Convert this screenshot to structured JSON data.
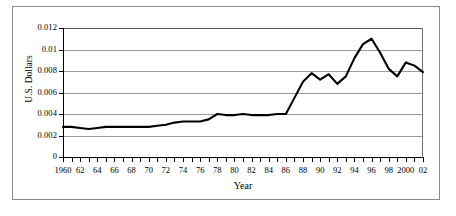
{
  "chart_data": {
    "type": "line",
    "title": "",
    "xlabel": "Year",
    "ylabel": "U.S. Dollars",
    "ylim": [
      0,
      0.012
    ],
    "xlim": [
      1960,
      2002
    ],
    "grid": true,
    "legend": "none",
    "ytick_labels": [
      "0.012",
      "0.01",
      "0.008",
      "0.006",
      "0.004",
      "0.002",
      "0"
    ],
    "ytick_values": [
      0.012,
      0.01,
      0.008,
      0.006,
      0.004,
      0.002,
      0
    ],
    "xtick_labels": [
      "1960",
      "62",
      "64",
      "66",
      "68",
      "70",
      "72",
      "74",
      "76",
      "78",
      "80",
      "82",
      "84",
      "86",
      "88",
      "90",
      "92",
      "94",
      "96",
      "98",
      "2000",
      "02"
    ],
    "xtick_values": [
      1960,
      1962,
      1964,
      1966,
      1968,
      1970,
      1972,
      1974,
      1976,
      1978,
      1980,
      1982,
      1984,
      1986,
      1988,
      1990,
      1992,
      1994,
      1996,
      1998,
      2000,
      2002
    ],
    "x": [
      1960,
      1961,
      1962,
      1963,
      1964,
      1965,
      1966,
      1967,
      1968,
      1969,
      1970,
      1971,
      1972,
      1973,
      1974,
      1975,
      1976,
      1977,
      1978,
      1979,
      1980,
      1981,
      1982,
      1983,
      1984,
      1985,
      1986,
      1987,
      1988,
      1989,
      1990,
      1991,
      1992,
      1993,
      1994,
      1995,
      1996,
      1997,
      1998,
      1999,
      2000,
      2001,
      2002
    ],
    "values": [
      0.0028,
      0.0028,
      0.0027,
      0.0026,
      0.0027,
      0.0028,
      0.0028,
      0.0028,
      0.0028,
      0.0028,
      0.0028,
      0.0029,
      0.003,
      0.0032,
      0.0033,
      0.0033,
      0.0033,
      0.0035,
      0.004,
      0.0039,
      0.0039,
      0.004,
      0.0039,
      0.0039,
      0.0039,
      0.004,
      0.004,
      0.0055,
      0.007,
      0.0078,
      0.0072,
      0.0077,
      0.0068,
      0.0075,
      0.0092,
      0.0105,
      0.011,
      0.0097,
      0.0082,
      0.0075,
      0.0088,
      0.0085,
      0.0079
    ],
    "series_name": "U.S. Dollars",
    "line_color": "#000000",
    "line_width": 2.1,
    "grid_color": "#9a9a9a",
    "background_color": "#ffffff"
  }
}
